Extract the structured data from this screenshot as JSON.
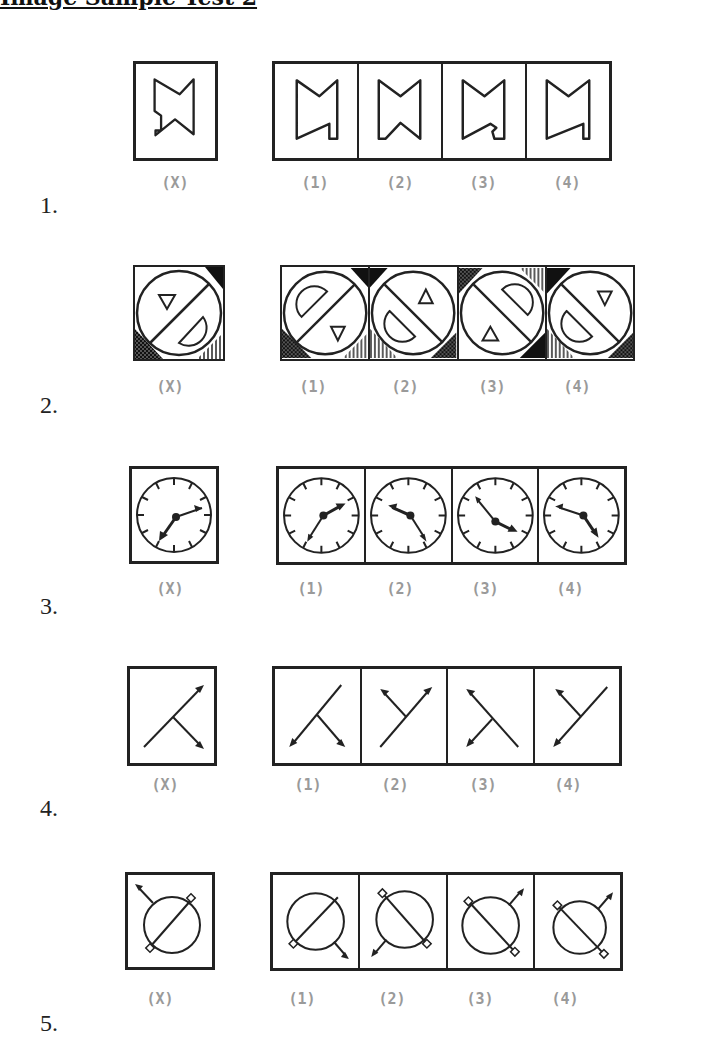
{
  "title": "Image Sample Test 2",
  "label_color": "#9a9a9a",
  "questions": [
    {
      "number": "1.",
      "figure_type": "notched-bowtie",
      "question_label": "(X)",
      "options": [
        "(1)",
        "(2)",
        "(3)",
        "(4)"
      ]
    },
    {
      "number": "2.",
      "figure_type": "circle-triangle-semicircle",
      "question_label": "(X)",
      "options": [
        "(1)",
        "(2)",
        "(3)",
        "(4)"
      ]
    },
    {
      "number": "3.",
      "figure_type": "clock-hands",
      "question_label": "(X)",
      "options": [
        "(1)",
        "(2)",
        "(3)",
        "(4)"
      ]
    },
    {
      "number": "4.",
      "figure_type": "arrow-branch",
      "question_label": "(X)",
      "options": [
        "(1)",
        "(2)",
        "(3)",
        "(4)"
      ]
    },
    {
      "number": "5.",
      "figure_type": "circle-diagonal-arrow",
      "question_label": "(X)",
      "options": [
        "(1)",
        "(2)",
        "(3)",
        "(4)"
      ]
    }
  ]
}
